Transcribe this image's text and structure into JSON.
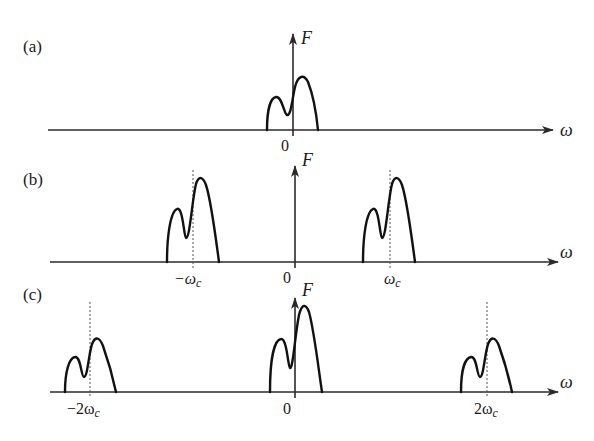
{
  "figure": {
    "colors": {
      "ink": "#111111",
      "axis": "#2a2a2a",
      "dashed": "#555555",
      "background": "#ffffff"
    },
    "panels": [
      {
        "id": "a",
        "label": "(a)",
        "y_axis_label": "F",
        "x_axis_label": "ω",
        "ticks": [
          "0"
        ],
        "spectrum_centers": [
          "0"
        ]
      },
      {
        "id": "b",
        "label": "(b)",
        "y_axis_label": "F",
        "x_axis_label": "ω",
        "ticks": [
          "−ωc",
          "0",
          "ωc"
        ],
        "spectrum_centers": [
          "−ωc",
          "ωc"
        ]
      },
      {
        "id": "c",
        "label": "(c)",
        "y_axis_label": "F",
        "x_axis_label": "ω",
        "ticks": [
          "−2ωc",
          "0",
          "2ωc"
        ],
        "spectrum_centers": [
          "−2ωc",
          "0",
          "2ωc"
        ]
      }
    ]
  },
  "labels": {
    "a": {
      "panel": "(a)",
      "F": "F",
      "omega": "ω",
      "zero": "0"
    },
    "b": {
      "panel": "(b)",
      "F": "F",
      "omega": "ω",
      "zero": "0",
      "neg_wc_sign": "−ω",
      "neg_wc_sub": "c",
      "wc": "ω",
      "wc_sub": "c"
    },
    "c": {
      "panel": "(c)",
      "F": "F",
      "omega": "ω",
      "zero": "0",
      "neg_2wc": "−2ω",
      "neg_2wc_sub": "c",
      "pos_2wc": "2ω",
      "pos_2wc_sub": "c"
    }
  }
}
